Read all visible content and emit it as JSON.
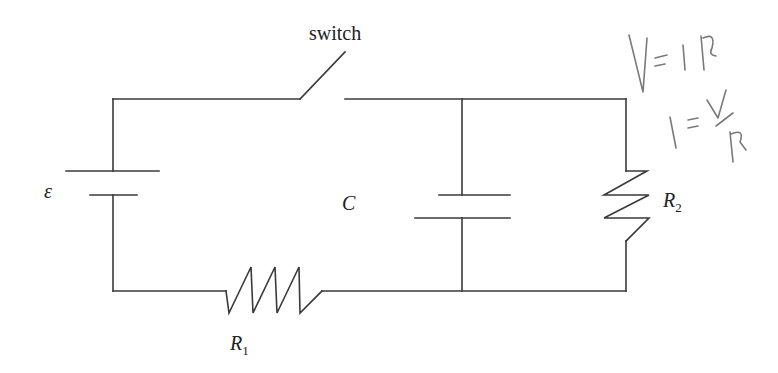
{
  "diagram": {
    "type": "circuit",
    "labels": {
      "switch": "switch",
      "emf": "ε",
      "capacitor": "C",
      "r1_main": "R",
      "r1_sub": "1",
      "r2_main": "R",
      "r2_sub": "2"
    },
    "components": [
      {
        "id": "battery",
        "label": "ε"
      },
      {
        "id": "switch",
        "label": "switch",
        "state": "open"
      },
      {
        "id": "resistor-1",
        "label": "R1"
      },
      {
        "id": "capacitor",
        "label": "C"
      },
      {
        "id": "resistor-2",
        "label": "R2"
      }
    ],
    "handwritten_notes": [
      "V=IR",
      "I=V/R"
    ],
    "colors": {
      "wire": "#3a3a3a",
      "ink": "#7a7a7a",
      "background": "#ffffff"
    }
  }
}
